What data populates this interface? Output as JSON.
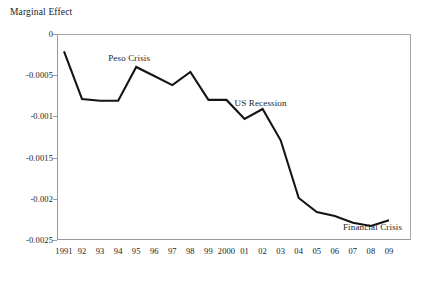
{
  "chart_data": {
    "type": "line",
    "title": "",
    "subtitle": "",
    "ylabel": "Marginal Effect",
    "xlabel": "",
    "grid": false,
    "legend": false,
    "legend_position": "none",
    "ylim": [
      -0.0025,
      0
    ],
    "ytick_labels": [
      "0",
      "-0.0005",
      "-0.001",
      "-0.0015",
      "-0.002",
      "-0.0025"
    ],
    "ytick_values": [
      0,
      -0.0005,
      -0.001,
      -0.0015,
      -0.002,
      -0.0025
    ],
    "categories": [
      "1991",
      "92",
      "93",
      "94",
      "95",
      "96",
      "97",
      "98",
      "99",
      "2000",
      "01",
      "02",
      "03",
      "04",
      "05",
      "06",
      "07",
      "08",
      "09"
    ],
    "x": [
      1991,
      1992,
      1993,
      1994,
      1995,
      1996,
      1997,
      1998,
      1999,
      2000,
      2001,
      2002,
      2003,
      2004,
      2005,
      2006,
      2007,
      2008,
      2009
    ],
    "values": [
      -0.00021,
      -0.00079,
      -0.00081,
      -0.00081,
      -0.0004,
      -0.00051,
      -0.00062,
      -0.00046,
      -0.0008,
      -0.0008,
      -0.00103,
      -0.00091,
      -0.00129,
      -0.00199,
      -0.00216,
      -0.00221,
      -0.00229,
      -0.00233,
      -0.00226
    ],
    "series": [
      {
        "name": "Marginal Effect",
        "color": "#141414",
        "values": [
          -0.00021,
          -0.00079,
          -0.00081,
          -0.00081,
          -0.0004,
          -0.00051,
          -0.00062,
          -0.00046,
          -0.0008,
          -0.0008,
          -0.00103,
          -0.00091,
          -0.00129,
          -0.00199,
          -0.00216,
          -0.00221,
          -0.00229,
          -0.00233,
          -0.00226
        ]
      }
    ],
    "annotations": [
      {
        "text": "Peso Crisis",
        "x": 1995,
        "y": -0.0003
      },
      {
        "text": "US Recession",
        "x": 2002,
        "y": -0.00085
      },
      {
        "text": "Financial Crisis",
        "x": 2008,
        "y": -0.00235
      }
    ]
  },
  "axis": {
    "y_title": "Marginal Effect",
    "y_ticks": [
      {
        "label": "0"
      },
      {
        "label": "-0.0005"
      },
      {
        "label": "-0.001"
      },
      {
        "label": "-0.0015"
      },
      {
        "label": "-0.002"
      },
      {
        "label": "-0.0025"
      }
    ],
    "x_ticks": [
      {
        "label": "1991"
      },
      {
        "label": "92"
      },
      {
        "label": "93"
      },
      {
        "label": "94"
      },
      {
        "label": "95"
      },
      {
        "label": "96"
      },
      {
        "label": "97"
      },
      {
        "label": "98"
      },
      {
        "label": "99"
      },
      {
        "label": "2000"
      },
      {
        "label": "01"
      },
      {
        "label": "02"
      },
      {
        "label": "03"
      },
      {
        "label": "04"
      },
      {
        "label": "05"
      },
      {
        "label": "06"
      },
      {
        "label": "07"
      },
      {
        "label": "08"
      },
      {
        "label": "09"
      }
    ]
  },
  "annotations": [
    {
      "label": "Peso Crisis"
    },
    {
      "label": "US Recession"
    },
    {
      "label": "Financial Crisis"
    }
  ],
  "colors": {
    "line": "#141414",
    "frame": "#9a9a9a",
    "text": "#1a1a1a",
    "background": "#ffffff"
  }
}
